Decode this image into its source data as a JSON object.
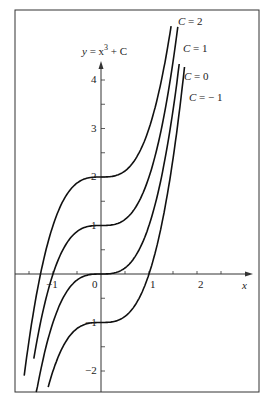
{
  "chart_data": {
    "type": "line",
    "title_display": {
      "y": "y",
      "eq": "= x",
      "pow": "3",
      "rest": "+ C"
    },
    "xlabel": "x",
    "ylabel": "",
    "xlim": [
      -1.8,
      3.2
    ],
    "ylim": [
      -2.5,
      5.4
    ],
    "x_ticks": [
      -1.5,
      -1,
      -0.5,
      0,
      0.5,
      1,
      1.5,
      2,
      2.5
    ],
    "x_tick_labels": [
      {
        "value": -1,
        "label": "−1"
      },
      {
        "value": 0,
        "label": "0"
      },
      {
        "value": 1,
        "label": "1"
      },
      {
        "value": 2,
        "label": "2"
      }
    ],
    "y_ticks": [
      -2,
      -1.5,
      -1,
      -0.5,
      0.5,
      1,
      1.5,
      2,
      2.5,
      3,
      3.5,
      4
    ],
    "y_tick_labels": [
      {
        "value": -2,
        "label": "−2"
      },
      {
        "value": -1,
        "label": "−1"
      },
      {
        "value": 1,
        "label": "1"
      },
      {
        "value": 2,
        "label": "2"
      },
      {
        "value": 3,
        "label": "3"
      },
      {
        "value": 4,
        "label": "4"
      }
    ],
    "grid": false,
    "legend": "inline labels at curve ends",
    "series": [
      {
        "name": "C = 2",
        "C": 2,
        "x_range": [
          -1.6,
          1.46
        ],
        "label": "C = 2"
      },
      {
        "name": "C = 1",
        "C": 1,
        "x_range": [
          -1.4,
          1.6
        ],
        "label": "C = 1"
      },
      {
        "name": "C = 0",
        "C": 0,
        "x_range": [
          -1.35,
          1.63
        ],
        "label": "C = 0"
      },
      {
        "name": "C = −1",
        "C": -1,
        "x_range": [
          -1.1,
          1.74
        ],
        "label": "C = − 1"
      }
    ],
    "annotations": [
      "y = x³ + C",
      "C = 2",
      "C = 1",
      "C = 0",
      "C = − 1"
    ]
  }
}
